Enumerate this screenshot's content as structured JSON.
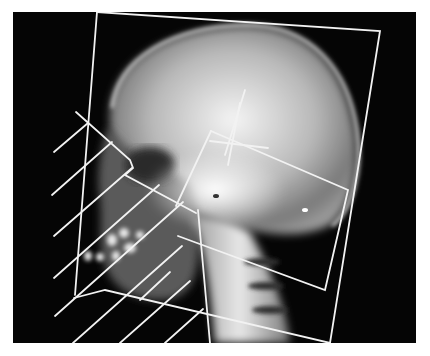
{
  "figure": {
    "type": "lateral skull radiograph with cephalometric overlay",
    "background_color": "#ffffff",
    "film_color": "#050505",
    "overlay_line_color": "#f2f2f2",
    "panel": {
      "x": 13,
      "y": 12,
      "width": 403,
      "height": 331
    }
  },
  "overlay": {
    "cranial_frame": [
      [
        97,
        0
      ],
      [
        380,
        30
      ],
      [
        330,
        343
      ],
      [
        90,
        305
      ]
    ],
    "cervical_frame": [
      [
        210,
        132
      ],
      [
        348,
        188
      ],
      [
        325,
        290
      ],
      [
        170,
        232
      ]
    ],
    "crosshair": {
      "vertical": [
        [
          240,
          103
        ],
        [
          228,
          165
        ]
      ],
      "horizontal": [
        [
          210,
          140
        ],
        [
          268,
          148
        ]
      ]
    },
    "facial_hatch_count": 9
  }
}
